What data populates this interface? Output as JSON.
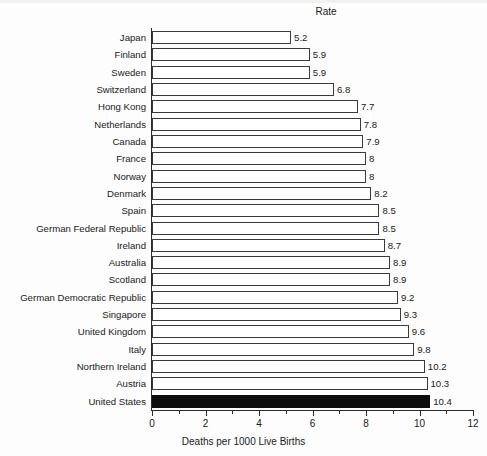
{
  "chart_data": {
    "type": "bar",
    "orientation": "horizontal",
    "title": "",
    "value_column_header": "Rate",
    "xlabel": "Deaths per 1000 Live Births",
    "ylabel": "",
    "xlim": [
      0,
      12
    ],
    "xticks": [
      0,
      2,
      4,
      6,
      8,
      10,
      12
    ],
    "xtick_labels": [
      "0",
      "2",
      "4",
      "6",
      "8",
      "10",
      "12"
    ],
    "grid": false,
    "legend": false,
    "highlight_category": "United States",
    "highlight_color": "#0d0d0d",
    "bar_fill_color": "#ffffff",
    "bar_edge_color": "#3a3a3a",
    "categories": [
      "Japan",
      "Finland",
      "Sweden",
      "Switzerland",
      "Hong Kong",
      "Netherlands",
      "Canada",
      "France",
      "Norway",
      "Denmark",
      "Spain",
      "German Federal Republic",
      "Ireland",
      "Australia",
      "Scotland",
      "German Democratic Republic",
      "Singapore",
      "United Kingdom",
      "Italy",
      "Northern Ireland",
      "Austria",
      "United States"
    ],
    "values": [
      5.2,
      5.9,
      5.9,
      6.8,
      7.7,
      7.8,
      7.9,
      8,
      8,
      8.2,
      8.5,
      8.5,
      8.7,
      8.9,
      8.9,
      9.2,
      9.3,
      9.6,
      9.8,
      10.2,
      10.3,
      10.4
    ],
    "value_labels": [
      "5.2",
      "5.9",
      "5.9",
      "6.8",
      "7.7",
      "7.8",
      "7.9",
      "8",
      "8",
      "8.2",
      "8.5",
      "8.5",
      "8.7",
      "8.9",
      "8.9",
      "9.2",
      "9.3",
      "9.6",
      "9.8",
      "10.2",
      "10.3",
      "10.4"
    ]
  }
}
